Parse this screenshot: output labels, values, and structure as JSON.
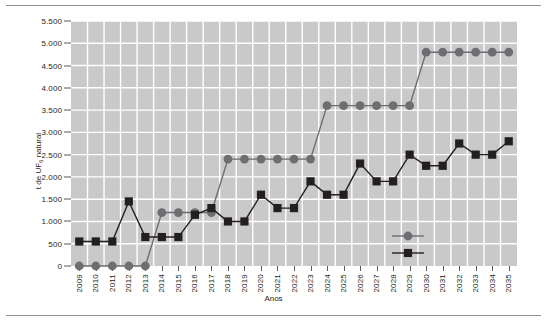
{
  "chart_data": {
    "type": "line",
    "title": "",
    "xlabel": "Anos",
    "ylabel": "t de UF6 natural",
    "ylabel_base": "t de UF",
    "ylabel_sub": "6",
    "ylabel_tail": " natural",
    "ylim": [
      0,
      5500
    ],
    "ytick_values": [
      0,
      500,
      1000,
      1500,
      2000,
      2500,
      3000,
      3500,
      4000,
      4500,
      5000,
      5500
    ],
    "ytick_labels": [
      "0",
      "500",
      "1.000",
      "1.500",
      "2.000",
      "2.500",
      "3.000",
      "3.500",
      "4.000",
      "4.500",
      "5.000",
      "5.500"
    ],
    "grid": true,
    "grid_color": "#ffffff",
    "plot_bg": "#c9c9c9",
    "legend_position": "inside-bottom-right",
    "categories": [
      "2009",
      "2010",
      "2011",
      "2012",
      "2013",
      "2014",
      "2015",
      "2016",
      "2017",
      "2018",
      "2019",
      "2020",
      "2021",
      "2022",
      "2023",
      "2024",
      "2025",
      "2026",
      "2027",
      "2028",
      "2029",
      "2030",
      "2031",
      "2032",
      "2033",
      "2034",
      "2035"
    ],
    "series": [
      {
        "name": "serie-circulo",
        "marker": "circle",
        "color": "#6d6e71",
        "label": "",
        "values": [
          0,
          0,
          0,
          0,
          0,
          1200,
          1200,
          1200,
          1200,
          2400,
          2400,
          2400,
          2400,
          2400,
          2400,
          3600,
          3600,
          3600,
          3600,
          3600,
          3600,
          4800,
          4800,
          4800,
          4800,
          4800,
          4800
        ]
      },
      {
        "name": "serie-quadrado",
        "marker": "square",
        "color": "#231f20",
        "label": "",
        "values": [
          550,
          550,
          550,
          1450,
          650,
          650,
          650,
          1150,
          1300,
          1000,
          1000,
          1600,
          1300,
          1300,
          1900,
          1600,
          1600,
          2300,
          1900,
          1900,
          2500,
          2250,
          2250,
          2750,
          2500,
          2500,
          2800
        ]
      }
    ]
  },
  "legend": {
    "items": [
      {
        "marker": "circle",
        "label": ""
      },
      {
        "marker": "square",
        "label": ""
      }
    ]
  }
}
